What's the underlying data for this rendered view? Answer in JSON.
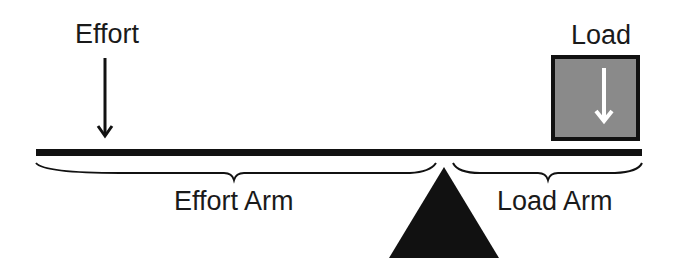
{
  "diagram": {
    "type": "first-class lever",
    "labels": {
      "effort": "Effort",
      "load": "Load",
      "effort_arm": "Effort Arm",
      "load_arm": "Load Arm"
    },
    "colors": {
      "background": "#ffffff",
      "ink": "#111111",
      "load_fill": "#8a8a8a",
      "load_arrow": "#ffffff"
    },
    "elements": {
      "beam": "horizontal bar",
      "fulcrum": "black triangle",
      "effort_arrow": "down-arrow",
      "load_box": "gray square with white down-arrow",
      "effort_arm_brace": "curly brace under beam left of fulcrum",
      "load_arm_brace": "curly brace under beam right of fulcrum"
    }
  }
}
